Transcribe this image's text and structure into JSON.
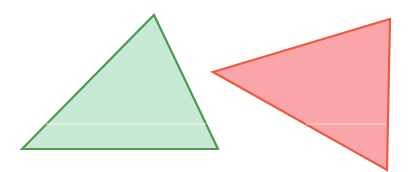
{
  "canvas": {
    "width": 417,
    "height": 172,
    "background": "#ffffff"
  },
  "shapes": [
    {
      "name": "green-triangle",
      "points": "22,149 154,15 218,149",
      "fill": "#c6ead5",
      "stroke": "#4f9a52",
      "stroke_width": 2.2
    },
    {
      "name": "red-triangle",
      "points": "213,72 390,19 387,170",
      "fill": "#f9a5aa",
      "stroke": "#ec5a3f",
      "stroke_width": 2.2
    }
  ],
  "artifacts": [
    {
      "name": "scan-line-green",
      "x1": 46,
      "y1": 124,
      "x2": 206,
      "y2": 124,
      "color": "#f4f8d8"
    },
    {
      "name": "scan-line-red",
      "x1": 306,
      "y1": 124,
      "x2": 386,
      "y2": 124,
      "color": "#fbe0c8"
    }
  ]
}
